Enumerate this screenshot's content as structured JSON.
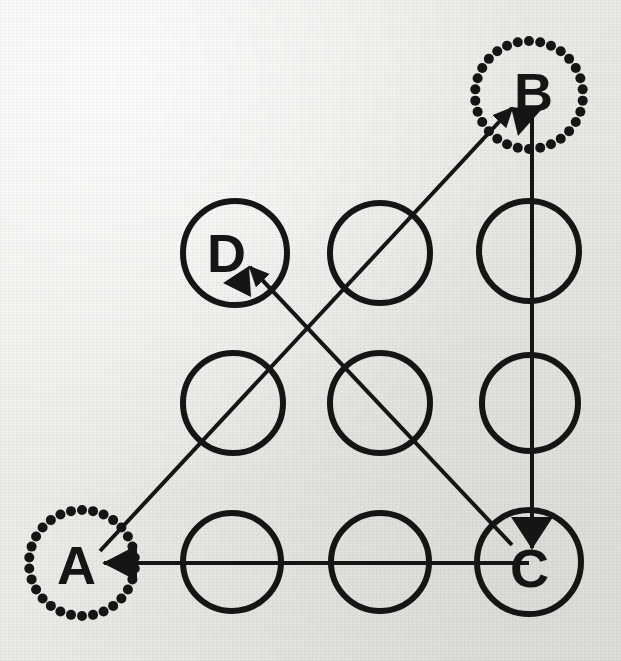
{
  "figure": {
    "kind": "pattern-lock-gesture-diagram",
    "background_color": "#efeeec",
    "ink_color": "#151515",
    "canvas": {
      "width": 621,
      "height": 661
    }
  },
  "grid": {
    "description": "3 by 3 array of solid outlined circles",
    "columns_x": [
      235,
      380,
      529
    ],
    "rows_y": [
      253,
      403,
      562
    ],
    "radius": 50,
    "stroke_width": 6,
    "circles": [
      {
        "id": "grid-r0c0",
        "cx": 235,
        "cy": 253,
        "r": 52,
        "label": "D",
        "style": "solid"
      },
      {
        "id": "grid-r0c1",
        "cx": 380,
        "cy": 253,
        "r": 50,
        "label": "",
        "style": "solid"
      },
      {
        "id": "grid-r0c2",
        "cx": 529,
        "cy": 251,
        "r": 50,
        "label": "",
        "style": "solid"
      },
      {
        "id": "grid-r1c0",
        "cx": 233,
        "cy": 403,
        "r": 50,
        "label": "",
        "style": "solid"
      },
      {
        "id": "grid-r1c1",
        "cx": 380,
        "cy": 403,
        "r": 50,
        "label": "",
        "style": "solid"
      },
      {
        "id": "grid-r1c2",
        "cx": 530,
        "cy": 403,
        "r": 48,
        "label": "",
        "style": "solid"
      },
      {
        "id": "grid-r2c0",
        "cx": 232,
        "cy": 562,
        "r": 49,
        "label": "",
        "style": "solid"
      },
      {
        "id": "grid-r2c1",
        "cx": 380,
        "cy": 562,
        "r": 49,
        "label": "",
        "style": "solid"
      },
      {
        "id": "grid-r2c2",
        "cx": 529,
        "cy": 562,
        "r": 52,
        "label": "C",
        "style": "solid"
      }
    ]
  },
  "marked_nodes": [
    {
      "id": "node-a",
      "label": "A",
      "cx": 82,
      "cy": 563,
      "r": 53,
      "style": "dotted",
      "dot_count": 30,
      "dot_radius": 5
    },
    {
      "id": "node-b",
      "label": "B",
      "cx": 529,
      "cy": 95,
      "r": 54,
      "style": "dotted",
      "dot_count": 30,
      "dot_radius": 5
    }
  ],
  "labels": [
    {
      "text": "A",
      "x": 76,
      "y": 565
    },
    {
      "text": "B",
      "x": 533,
      "y": 92
    },
    {
      "text": "C",
      "x": 529,
      "y": 568
    },
    {
      "text": "D",
      "x": 226,
      "y": 253
    }
  ],
  "connections": [
    {
      "id": "edge-a-to-b",
      "from": "A",
      "to": "B",
      "direction": "up-right",
      "x1": 100,
      "y1": 551,
      "x2": 512,
      "y2": 108,
      "arrowhead": "at-end",
      "stroke_width": 4
    },
    {
      "id": "edge-b-to-c",
      "from": "B",
      "to": "C",
      "direction": "down",
      "x1": 532,
      "y1": 118,
      "x2": 532,
      "y2": 548,
      "arrowhead": "at-end",
      "stroke_width": 4
    },
    {
      "id": "edge-c-to-d",
      "from": "C",
      "to": "D",
      "direction": "up-left",
      "x1": 512,
      "y1": 545,
      "x2": 249,
      "y2": 266,
      "arrowhead": "at-end",
      "stroke_width": 4
    },
    {
      "id": "edge-c-to-a",
      "from": "C",
      "to": "A",
      "direction": "left",
      "x1": 529,
      "y1": 563,
      "x2": 103,
      "y2": 563,
      "arrowhead": "at-end",
      "stroke_width": 4
    }
  ],
  "sequence": [
    "A",
    "B",
    "C",
    "D"
  ]
}
